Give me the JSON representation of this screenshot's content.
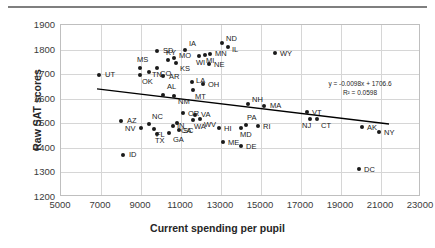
{
  "chart_data": {
    "type": "scatter",
    "title": "",
    "xlabel": "Current spending per pupil",
    "ylabel": "Raw SAT scores",
    "xlim": [
      5000,
      23000
    ],
    "ylim": [
      1200,
      1900
    ],
    "xticks": [
      5000,
      7000,
      9000,
      11000,
      13000,
      15000,
      17000,
      19000,
      21000,
      23000
    ],
    "yticks": [
      1200,
      1300,
      1400,
      1500,
      1600,
      1700,
      1800,
      1900
    ],
    "grid": true,
    "legend": null,
    "trendline": {
      "equation": "y = -0.0098x + 1706.6",
      "r_squared": "R² = 0.0598",
      "slope": -0.0098,
      "intercept": 1706.6,
      "x_start": 6800,
      "x_end": 21400
    },
    "point_label_key": "state",
    "points": [
      {
        "state": "UT",
        "x": 6900,
        "y": 1695,
        "lx": 6,
        "ly": -4
      },
      {
        "state": "ID",
        "x": 8100,
        "y": 1369,
        "lx": 6,
        "ly": -4
      },
      {
        "state": "AZ",
        "x": 8000,
        "y": 1509,
        "lx": 6,
        "ly": -4
      },
      {
        "state": "MS",
        "x": 8950,
        "y": 1723,
        "lx": -3,
        "ly": -12
      },
      {
        "state": "OK",
        "x": 8950,
        "y": 1697,
        "lx": 2,
        "ly": 3
      },
      {
        "state": "TN",
        "x": 9400,
        "y": 1710,
        "lx": 3,
        "ly": -1
      },
      {
        "state": "SD",
        "x": 9800,
        "y": 1793,
        "lx": 6,
        "ly": -4
      },
      {
        "state": "CO",
        "x": 9800,
        "y": 1727,
        "lx": 3,
        "ly": 2
      },
      {
        "state": "KY",
        "x": 10350,
        "y": 1756,
        "lx": -2,
        "ly": -11
      },
      {
        "state": "MO",
        "x": 10650,
        "y": 1764,
        "lx": 5,
        "ly": -6
      },
      {
        "state": "KS",
        "x": 10750,
        "y": 1744,
        "lx": 4,
        "ly": 2
      },
      {
        "state": "AR",
        "x": 10100,
        "y": 1693,
        "lx": 6,
        "ly": -3
      },
      {
        "state": "AL",
        "x": 10100,
        "y": 1617,
        "lx": 0,
        "ly": -12
      },
      {
        "state": "NM",
        "x": 10650,
        "y": 1610,
        "lx": 4,
        "ly": 2
      },
      {
        "state": "NV",
        "x": 9000,
        "y": 1481,
        "lx": -16,
        "ly": -3
      },
      {
        "state": "NC",
        "x": 9400,
        "y": 1498,
        "lx": 3,
        "ly": -11
      },
      {
        "state": "FL",
        "x": 9650,
        "y": 1478,
        "lx": 2,
        "ly": 2
      },
      {
        "state": "TX",
        "x": 9800,
        "y": 1455,
        "lx": -2,
        "ly": 3
      },
      {
        "state": "GA",
        "x": 10400,
        "y": 1462,
        "lx": 0,
        "ly": 3
      },
      {
        "state": "IN",
        "x": 10600,
        "y": 1487,
        "lx": 4,
        "ly": -4
      },
      {
        "state": "SC",
        "x": 10900,
        "y": 1473,
        "lx": 4,
        "ly": 0
      },
      {
        "state": "CA",
        "x": 10800,
        "y": 1500,
        "lx": 0,
        "ly": 4
      },
      {
        "state": "IA",
        "x": 11200,
        "y": 1799,
        "lx": 0,
        "ly": -10
      },
      {
        "state": "WI",
        "x": 11900,
        "y": 1774,
        "lx": -3,
        "ly": 3
      },
      {
        "state": "MI",
        "x": 12200,
        "y": 1778,
        "lx": 1,
        "ly": 2
      },
      {
        "state": "MN",
        "x": 12450,
        "y": 1781,
        "lx": 5,
        "ly": -4
      },
      {
        "state": "NE",
        "x": 12400,
        "y": 1743,
        "lx": 5,
        "ly": -3
      },
      {
        "state": "OH",
        "x": 12100,
        "y": 1661,
        "lx": 5,
        "ly": -3
      },
      {
        "state": "LA",
        "x": 11550,
        "y": 1668,
        "lx": 4,
        "ly": -5
      },
      {
        "state": "MT",
        "x": 11600,
        "y": 1637,
        "lx": 2,
        "ly": 3
      },
      {
        "state": "OR",
        "x": 11100,
        "y": 1540,
        "lx": 5,
        "ly": -3
      },
      {
        "state": "VA",
        "x": 11700,
        "y": 1533,
        "lx": 6,
        "ly": -4
      },
      {
        "state": "WA",
        "x": 11600,
        "y": 1513,
        "lx": 1,
        "ly": 3
      },
      {
        "state": "WV",
        "x": 11950,
        "y": 1516,
        "lx": 4,
        "ly": 2
      },
      {
        "state": "HI",
        "x": 12900,
        "y": 1482,
        "lx": 5,
        "ly": -3
      },
      {
        "state": "ME",
        "x": 13100,
        "y": 1424,
        "lx": 5,
        "ly": -3
      },
      {
        "state": "ND",
        "x": 13050,
        "y": 1827,
        "lx": 4,
        "ly": -8
      },
      {
        "state": "IL",
        "x": 13350,
        "y": 1811,
        "lx": 4,
        "ly": -1
      },
      {
        "state": "WY",
        "x": 15700,
        "y": 1787,
        "lx": 5,
        "ly": -3
      },
      {
        "state": "NH",
        "x": 14350,
        "y": 1577,
        "lx": 4,
        "ly": -8
      },
      {
        "state": "MA",
        "x": 15150,
        "y": 1569,
        "lx": 6,
        "ly": -4
      },
      {
        "state": "PA",
        "x": 14250,
        "y": 1493,
        "lx": 1,
        "ly": -11
      },
      {
        "state": "MD",
        "x": 14000,
        "y": 1480,
        "lx": -1,
        "ly": 3
      },
      {
        "state": "RI",
        "x": 14850,
        "y": 1488,
        "lx": 5,
        "ly": -3
      },
      {
        "state": "DE",
        "x": 14000,
        "y": 1408,
        "lx": 5,
        "ly": -3
      },
      {
        "state": "VT",
        "x": 17300,
        "y": 1545,
        "lx": 5,
        "ly": -3
      },
      {
        "state": "NJ",
        "x": 17450,
        "y": 1519,
        "lx": -8,
        "ly": 3
      },
      {
        "state": "CT",
        "x": 17800,
        "y": 1516,
        "lx": 4,
        "ly": 3
      },
      {
        "state": "AK",
        "x": 20050,
        "y": 1486,
        "lx": 5,
        "ly": -3
      },
      {
        "state": "NY",
        "x": 20900,
        "y": 1464,
        "lx": 5,
        "ly": -3
      },
      {
        "state": "DC",
        "x": 19900,
        "y": 1314,
        "lx": 5,
        "ly": -3
      }
    ]
  }
}
